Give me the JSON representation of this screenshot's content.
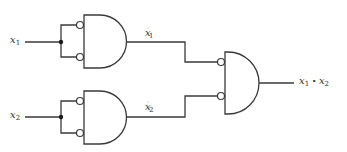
{
  "diagram": {
    "title": "",
    "inputs": [
      {
        "id": "x1",
        "var": "x",
        "sub": "1"
      },
      {
        "id": "x2",
        "var": "x",
        "sub": "2"
      }
    ],
    "intermediate": [
      {
        "id": "x1_comp",
        "var": "x",
        "sub": "1",
        "prime": "′"
      },
      {
        "id": "x2_comp",
        "var": "x",
        "sub": "2",
        "prime": "′"
      }
    ],
    "output": {
      "left_var": "x",
      "left_sub": "1",
      "op": " • ",
      "right_var": "x",
      "right_sub": "2"
    },
    "gates": [
      {
        "id": "gate-1",
        "type": "AND with inverted inputs (NOR)",
        "inputs": [
          "x1",
          "x1"
        ],
        "output": "x1'"
      },
      {
        "id": "gate-2",
        "type": "AND with inverted inputs (NOR)",
        "inputs": [
          "x2",
          "x2"
        ],
        "output": "x2'"
      },
      {
        "id": "gate-3",
        "type": "AND with inverted inputs (NOR)",
        "inputs": [
          "x1'",
          "x2'"
        ],
        "output": "x1 • x2"
      }
    ],
    "colors": {
      "line": "#3a3a3a",
      "background": "#ffffff"
    }
  }
}
